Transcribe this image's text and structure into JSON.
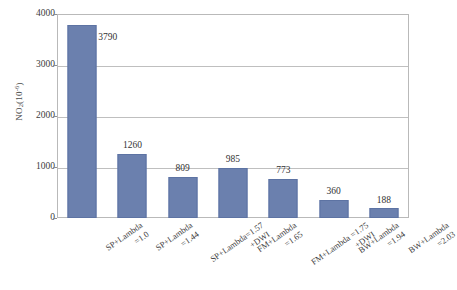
{
  "chart_data": {
    "type": "bar",
    "title": "",
    "xlabel": "",
    "ylabel": "NO2(10-6)",
    "ylabel_parts": {
      "base": "NO",
      "sub": "2",
      "paren_open": "(10",
      "sup": "-6",
      "paren_close": ")"
    },
    "ylim": [
      0,
      4000
    ],
    "yticks": [
      0,
      1000,
      2000,
      3000,
      4000
    ],
    "ytick_labels": [
      "0",
      "1000",
      "2000",
      "3000",
      "4000"
    ],
    "grid": true,
    "legend": false,
    "categories": [
      "SP+Lambda =1.0",
      "SP+Lambda =1.44",
      "SP+Lambda=1.57 +DWI",
      "DWI FM+Lambda =1.65",
      "FM+Lambda =1.75 +DWI",
      "BW+Lambda =1.94",
      "BW+Lambda =2.03"
    ],
    "category_lines": [
      [
        "SP+Lambda",
        "=1.0"
      ],
      [
        "SP+Lambda",
        "=1.44"
      ],
      [
        "SP+Lambda=1.57",
        "+DWI"
      ],
      [
        "FM+Lambda",
        "=1.65"
      ],
      [
        "FM+Lambda =1.75",
        "+DWI"
      ],
      [
        "BW+Lambda",
        "=1.94"
      ],
      [
        "BW+Lambda",
        "=2.03"
      ]
    ],
    "values": [
      3790,
      1260,
      809,
      985,
      773,
      360,
      188
    ],
    "value_labels": [
      "3790",
      "1260",
      "809",
      "985",
      "773",
      "360",
      "188"
    ],
    "bar_color": "#6b80ae",
    "grid_color": "#bfbfbf",
    "frame_color": "#b9b9b9",
    "text_color": "#3c3c3c"
  }
}
